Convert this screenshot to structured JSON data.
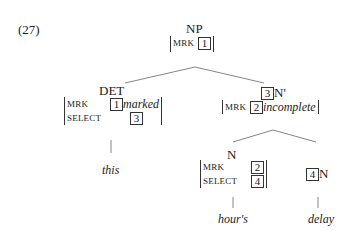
{
  "example_number": "(27)",
  "root": {
    "category": "NP",
    "features": [
      {
        "attr": "MRK",
        "tag": "1",
        "value": ""
      }
    ]
  },
  "det": {
    "category": "DET",
    "features": [
      {
        "attr": "MRK",
        "tag": "1",
        "value": "marked"
      },
      {
        "attr": "SELECT",
        "tag": "3",
        "value": ""
      }
    ],
    "word": "this"
  },
  "nbar": {
    "tag": "3",
    "category": "N'",
    "features": [
      {
        "attr": "MRK",
        "tag": "2",
        "value": "incomplete"
      }
    ]
  },
  "n1": {
    "category": "N",
    "features": [
      {
        "attr": "MRK",
        "tag": "2",
        "value": ""
      },
      {
        "attr": "SELECT",
        "tag": "4",
        "value": ""
      }
    ],
    "word": "hour's"
  },
  "n2": {
    "tag": "4",
    "category": "N",
    "word": "delay"
  }
}
